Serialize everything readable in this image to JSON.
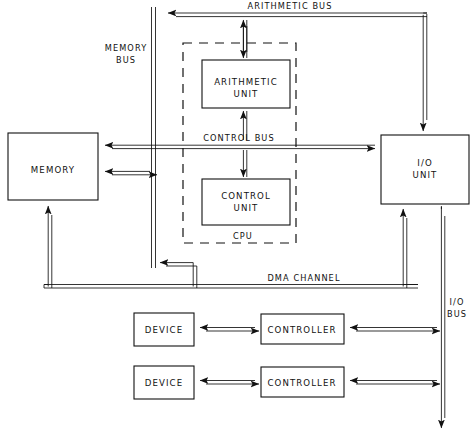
{
  "diagram": {
    "stroke_color": "#111111",
    "background_color": "#ffffff",
    "boxes": {
      "memory": {
        "label": "MEMORY"
      },
      "arithmetic_unit": {
        "label_line1": "ARITHMETIC",
        "label_line2": "UNIT"
      },
      "control_unit": {
        "label_line1": "CONTROL",
        "label_line2": "UNIT"
      },
      "io_unit": {
        "label_line1": "I/O",
        "label_line2": "UNIT"
      },
      "device_1": {
        "label": "DEVICE"
      },
      "device_2": {
        "label": "DEVICE"
      },
      "controller_1": {
        "label": "CONTROLLER"
      },
      "controller_2": {
        "label": "CONTROLLER"
      }
    },
    "labels": {
      "cpu": "CPU",
      "arithmetic_bus": "ARITHMETIC BUS",
      "memory_bus_line1": "MEMORY",
      "memory_bus_line2": "BUS",
      "control_bus": "CONTROL  BUS",
      "dma_channel": "DMA  CHANNEL",
      "io_bus_line1": "I/O",
      "io_bus_line2": "BUS"
    }
  }
}
